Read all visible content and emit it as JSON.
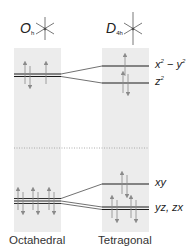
{
  "diagram": {
    "type": "crystal-field-splitting",
    "colors": {
      "band": "#ececec",
      "level": "#1a1a1a",
      "arrow": "#8a8a8a",
      "dotted": "#9a9a9a"
    },
    "columns": [
      {
        "id": "octahedral",
        "label": "Octahedral",
        "point_group": {
          "symbol": "O",
          "subscript": "h"
        }
      },
      {
        "id": "tetragonal",
        "label": "Tetragonal",
        "point_group": {
          "symbol": "D",
          "subscript": "4h"
        }
      }
    ],
    "levels": {
      "octahedral_upper": {
        "label": "",
        "degeneracy": 2,
        "electrons": "↑↓ ↑"
      },
      "octahedral_lower": {
        "label": "",
        "degeneracy": 3,
        "electrons": "↑↓ ↑↓ ↑↓"
      },
      "tetragonal": [
        {
          "label": "x² − y²",
          "label_parts": [
            "x",
            "2",
            " − ",
            "y",
            "2"
          ],
          "electrons": "↑"
        },
        {
          "label": "z²",
          "label_parts": [
            "z",
            "2"
          ],
          "electrons": "↑↓"
        },
        {
          "label": "xy",
          "electrons": "↑↓"
        },
        {
          "label": "yz, zx",
          "electrons": "↑↓ ↑↓"
        }
      ]
    },
    "separator": "dotted"
  }
}
